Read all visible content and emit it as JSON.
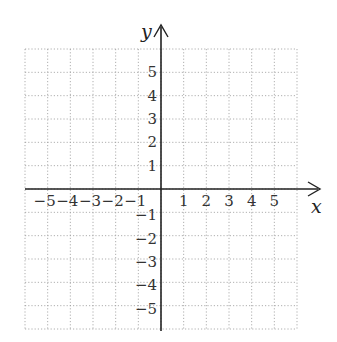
{
  "chart_data": {
    "type": "scatter",
    "title": "",
    "xlabel": "x",
    "ylabel": "y",
    "xlim": [
      -6,
      6
    ],
    "ylim": [
      -6,
      6
    ],
    "grid": true,
    "grid_style": "dotted",
    "x_ticks": [
      -5,
      -4,
      -3,
      -2,
      -1,
      1,
      2,
      3,
      4,
      5
    ],
    "y_ticks": [
      5,
      4,
      3,
      2,
      1,
      -1,
      -2,
      -3,
      -4,
      -5
    ],
    "x_tick_labels": [
      "−5",
      "−4",
      "−3",
      "−2",
      "−1",
      "1",
      "2",
      "3",
      "4",
      "5"
    ],
    "y_tick_labels": [
      "5",
      "4",
      "3",
      "2",
      "1",
      "−1",
      "−2",
      "−3",
      "−4",
      "−5"
    ],
    "series": [],
    "colors": {
      "axis": "#222222",
      "grid": "#9a9a9a",
      "text": "#333333"
    }
  },
  "axes": {
    "x_label": "x",
    "y_label": "y"
  }
}
